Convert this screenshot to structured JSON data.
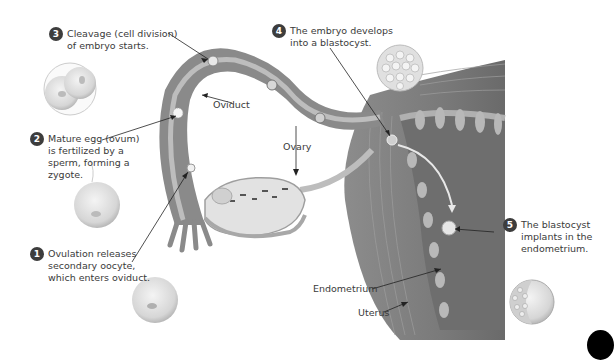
{
  "figure": {
    "steps": [
      {
        "number": "1",
        "text": "Ovulation releases\nsecondary oocyte,\nwhich enters oviduct."
      },
      {
        "number": "2",
        "text": "Mature egg (ovum)\nis fertilized by a\nsperm, forming a\nzygote."
      },
      {
        "number": "3",
        "text": "Cleavage (cell division)\nof embryo starts."
      },
      {
        "number": "4",
        "text": "The embryo develops\ninto a blastocyst."
      },
      {
        "number": "5",
        "text": "The blastocyst\nimplants in the\nendometrium."
      }
    ],
    "labels": {
      "oviduct": "Oviduct",
      "ovary": "Ovary",
      "endometrium": "Endometrium",
      "uterus": "Uterus"
    },
    "colors": {
      "badge": "#3d3d3d",
      "tissue_dark": "#7a7a7a",
      "tissue_mid": "#9a9a9a",
      "tissue_light": "#c4c4c4",
      "cell_fill": "#e6e6e6",
      "arrow": "#222222",
      "path_arrow": "#e8e8e8"
    }
  }
}
